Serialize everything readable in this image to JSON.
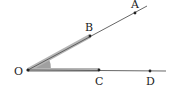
{
  "diagram": {
    "type": "geometry-angle",
    "vertex": {
      "label": "O",
      "x": 28,
      "y": 70
    },
    "rays": [
      {
        "name": "ray-OA",
        "points": [
          {
            "label": "B",
            "x": 90,
            "y": 36
          },
          {
            "label": "A",
            "x": 135,
            "y": 13
          }
        ]
      },
      {
        "name": "ray-OD",
        "points": [
          {
            "label": "C",
            "x": 99,
            "y": 70
          },
          {
            "label": "D",
            "x": 150,
            "y": 71
          }
        ]
      }
    ],
    "highlighted_segments": [
      "OB",
      "OC"
    ],
    "shaded_angle": "BOC",
    "labels": {
      "O": "O",
      "A": "A",
      "B": "B",
      "C": "C",
      "D": "D"
    },
    "colors": {
      "line": "#555555",
      "highlight": "#aaaaaa",
      "angle_fill": "#9a9a9a",
      "point": "#222222"
    }
  }
}
